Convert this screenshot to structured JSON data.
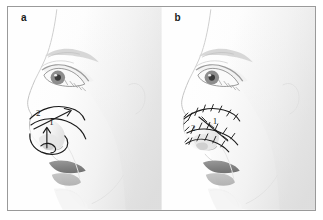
{
  "figure": {
    "type": "medical-illustration",
    "border_color": "#9a9a9a",
    "background_color": "#ffffff"
  },
  "panels": [
    {
      "id": "a",
      "label": "a",
      "caption": "",
      "subject": "female-lateral-face-profile",
      "annotations": [
        {
          "id": "mark-1",
          "label": "1",
          "kind": "arrow-vertical",
          "description": "vertical arrow at columella base indicating caudal septum advancement"
        },
        {
          "id": "mark-2",
          "label": "2",
          "kind": "arrow-diagonal",
          "description": "diagonal arrow along nasal dorsum indicating direction of rotation"
        },
        {
          "id": "incision-outline",
          "label": "",
          "kind": "outline",
          "description": "marked incision outline over nasal tip and alar region"
        }
      ]
    },
    {
      "id": "b",
      "label": "b",
      "caption": "",
      "subject": "female-lateral-face-profile",
      "annotations": [
        {
          "id": "suture-1",
          "label": "1",
          "kind": "suture-line",
          "description": "sutured line running from nasal dorsum down to nasal tip"
        },
        {
          "id": "suture-2",
          "label": "2",
          "kind": "suture-line",
          "description": "sutured line along alar crease"
        },
        {
          "id": "suture-net",
          "label": "",
          "kind": "suture-network",
          "description": "network of cross-hatched suture marks over nasal tip and ala"
        }
      ]
    }
  ],
  "colors": {
    "ink": "#1b1b1b",
    "skin_light": "#fbfbfb",
    "skin_shade": "#e9e9e9",
    "skin_shade_deep": "#d8d8d8",
    "lip": "#8e8e8e",
    "lip_lower": "#a8a8a8",
    "eye_iris": "#6f6f6f",
    "outline": "#bdbdbd",
    "frame": "#9a9a9a"
  }
}
